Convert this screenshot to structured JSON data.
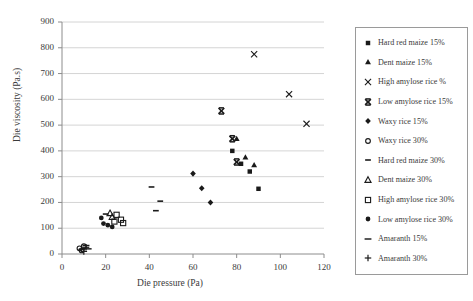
{
  "figure": {
    "background": "#ffffff",
    "marker_color": "#1a1a1a",
    "grid_color": "#c9c9c9",
    "axis_color": "#8c8c8c",
    "legend_border": "#9a9a9a"
  },
  "chart_data": {
    "type": "scatter",
    "title": "",
    "xlabel": "Die pressure (Pa)",
    "ylabel": "Die viscosity (Pa.s)",
    "xlim": [
      0,
      120
    ],
    "ylim": [
      0,
      900
    ],
    "xticks": [
      0,
      20,
      40,
      60,
      80,
      100,
      120
    ],
    "yticks": [
      0,
      100,
      200,
      300,
      400,
      500,
      600,
      700,
      800,
      900
    ],
    "grid": "horizontal",
    "legend_position": "right-outside",
    "series": [
      {
        "name": "Hard red maize 15%",
        "marker": "square-filled",
        "points": [
          [
            78,
            400
          ],
          [
            82,
            350
          ],
          [
            86,
            320
          ],
          [
            90,
            253
          ]
        ]
      },
      {
        "name": "Dent maize 15%",
        "marker": "triangle-filled",
        "points": [
          [
            80,
            447
          ],
          [
            84,
            375
          ],
          [
            88,
            345
          ]
        ]
      },
      {
        "name": "High amylose rice %",
        "marker": "x-thin",
        "points": [
          [
            88,
            775
          ],
          [
            104,
            620
          ],
          [
            112,
            505
          ]
        ]
      },
      {
        "name": "Low amylose rice 15%",
        "marker": "x-bold",
        "points": [
          [
            73,
            555
          ],
          [
            78,
            447
          ],
          [
            80,
            357
          ]
        ]
      },
      {
        "name": "Waxy rice 15%",
        "marker": "diamond-filled",
        "points": [
          [
            60,
            312
          ],
          [
            64,
            255
          ],
          [
            68,
            200
          ]
        ]
      },
      {
        "name": "Waxy rice 30%",
        "marker": "circle-open",
        "points": [
          [
            8,
            22
          ],
          [
            9,
            14
          ],
          [
            10,
            30
          ]
        ]
      },
      {
        "name": "Hard red maize 30%",
        "marker": "dash-small",
        "points": [
          [
            41,
            260
          ],
          [
            45,
            205
          ],
          [
            43,
            168
          ],
          [
            20,
            155
          ]
        ]
      },
      {
        "name": "Dent maize 30%",
        "marker": "triangle-open",
        "points": [
          [
            22,
            158
          ],
          [
            23,
            143
          ]
        ]
      },
      {
        "name": "High amylose rice 30%",
        "marker": "square-open",
        "points": [
          [
            25,
            152
          ],
          [
            27,
            133
          ],
          [
            28,
            120
          ],
          [
            24,
            126
          ]
        ]
      },
      {
        "name": "Low amylose rice 30%",
        "marker": "circle-filled",
        "points": [
          [
            18,
            140
          ],
          [
            19,
            118
          ],
          [
            21,
            112
          ],
          [
            23,
            105
          ]
        ]
      },
      {
        "name": "Amaranth 15%",
        "marker": "dash-wide",
        "points": [
          [
            11,
            33
          ],
          [
            12,
            20
          ]
        ]
      },
      {
        "name": "Amaranth 30%",
        "marker": "plus",
        "points": [
          [
            9,
            18
          ],
          [
            10,
            10
          ],
          [
            11,
            26
          ]
        ]
      }
    ]
  }
}
